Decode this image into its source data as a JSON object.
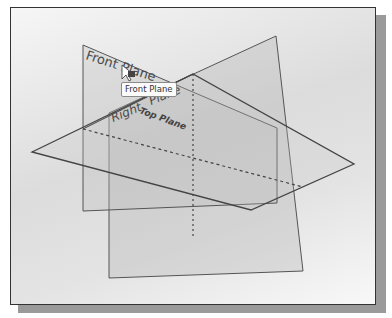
{
  "scene": {
    "colors": {
      "plane_edge": "#555555",
      "plane_fill": "#c8c8c8",
      "label_text": "#4a4a4a",
      "frame": "#333333",
      "shadow": "#9a9a9a"
    },
    "planes": [
      {
        "name": "Front Plane",
        "label": "Front Plane"
      },
      {
        "name": "Right Plane",
        "label": "Right Plane"
      },
      {
        "name": "Top Plane",
        "label": "Top Plane"
      }
    ],
    "labels": {
      "front": "Front Plane",
      "right": "Right",
      "right_partial": "Plane",
      "top": "Top Plane"
    },
    "tooltip": "Front Plane",
    "cursor": "select-pointer"
  }
}
